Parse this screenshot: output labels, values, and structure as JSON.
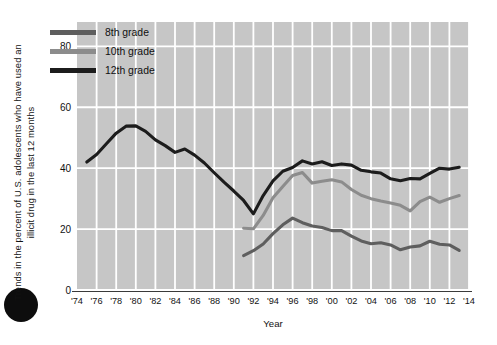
{
  "chart_data": {
    "type": "line",
    "title": "",
    "xlabel": "Year",
    "ylabel": "Trends in the percent of U.S. adolescents  who have used an illicit drug in the last 12 months",
    "xlim": [
      1974,
      2014
    ],
    "ylim": [
      0,
      88
    ],
    "y_ticks": [
      0,
      20,
      40,
      60,
      80
    ],
    "x_ticks": [
      1974,
      1976,
      1978,
      1980,
      1982,
      1984,
      1986,
      1988,
      1990,
      1992,
      1994,
      1996,
      1998,
      2000,
      2002,
      2004,
      2006,
      2008,
      2010,
      2012,
      2014
    ],
    "x_tick_labels": [
      "'74",
      "'76",
      "'78",
      "'80",
      "'82",
      "'84",
      "'86",
      "'88",
      "'90",
      "'92",
      "'94",
      "'96",
      "'98",
      "'00",
      "'02",
      "'04",
      "'06",
      "'08",
      "'10",
      "'12",
      "'14"
    ],
    "grid": true,
    "grid_color": "#ffffff",
    "plot_background": "#c6c6c6",
    "legend_position": "top-left-inside",
    "series": [
      {
        "name": "8th grade",
        "color": "#5e5e5e",
        "x": [
          1991,
          1992,
          1993,
          1994,
          1995,
          1996,
          1997,
          1998,
          1999,
          2000,
          2001,
          2002,
          2003,
          2004,
          2005,
          2006,
          2007,
          2008,
          2009,
          2010,
          2011,
          2012,
          2013
        ],
        "values": [
          11.3,
          12.9,
          15.1,
          18.5,
          21.4,
          23.6,
          22.1,
          21.0,
          20.5,
          19.5,
          19.5,
          17.7,
          16.1,
          15.2,
          15.5,
          14.8,
          13.2,
          14.1,
          14.5,
          16.0,
          15.0,
          14.8,
          13.0
        ]
      },
      {
        "name": "10th grade",
        "color": "#8c8c8c",
        "x": [
          1991,
          1992,
          1993,
          1994,
          1995,
          1996,
          1997,
          1998,
          1999,
          2000,
          2001,
          2002,
          2003,
          2004,
          2005,
          2006,
          2007,
          2008,
          2009,
          2010,
          2011,
          2012,
          2013
        ],
        "values": [
          20.3,
          20.1,
          24.5,
          30.3,
          34.0,
          37.6,
          38.6,
          35.1,
          35.7,
          36.2,
          35.5,
          33.0,
          31.1,
          30.0,
          29.2,
          28.6,
          27.8,
          26.0,
          29.0,
          30.5,
          28.8,
          30.0,
          31.0
        ]
      },
      {
        "name": "12th grade",
        "color": "#1c1c1c",
        "x": [
          1975,
          1976,
          1977,
          1978,
          1979,
          1980,
          1981,
          1982,
          1983,
          1984,
          1985,
          1986,
          1987,
          1988,
          1989,
          1990,
          1991,
          1992,
          1993,
          1994,
          1995,
          1996,
          1997,
          1998,
          1999,
          2000,
          2001,
          2002,
          2003,
          2004,
          2005,
          2006,
          2007,
          2008,
          2009,
          2010,
          2011,
          2012,
          2013
        ],
        "values": [
          42.0,
          44.5,
          48.0,
          51.5,
          53.8,
          53.9,
          52.1,
          49.3,
          47.4,
          45.2,
          46.3,
          44.3,
          41.7,
          38.5,
          35.4,
          32.5,
          29.4,
          25.0,
          31.0,
          35.8,
          39.0,
          40.2,
          42.4,
          41.4,
          42.1,
          40.9,
          41.4,
          41.0,
          39.3,
          38.8,
          38.4,
          36.5,
          35.9,
          36.6,
          36.5,
          38.3,
          40.0,
          39.7,
          40.3
        ]
      }
    ]
  },
  "legend": {
    "items": [
      {
        "label": "8th grade",
        "color": "#5e5e5e"
      },
      {
        "label": "10th grade",
        "color": "#8c8c8c"
      },
      {
        "label": "12th grade",
        "color": "#1c1c1c"
      }
    ]
  },
  "axes": {
    "y_title": "Trends in the percent of U.S. adolescents  who have used an illicit drug in the last 12 months",
    "x_title": "Year",
    "y_tick_labels": [
      "0",
      "20",
      "40",
      "60",
      "80"
    ],
    "x_tick_labels": [
      "'74",
      "'76",
      "'78",
      "'80",
      "'82",
      "'84",
      "'86",
      "'88",
      "'90",
      "'92",
      "'94",
      "'96",
      "'98",
      "'00",
      "'02",
      "'04",
      "'06",
      "'08",
      "'10",
      "'12",
      "'14"
    ]
  }
}
